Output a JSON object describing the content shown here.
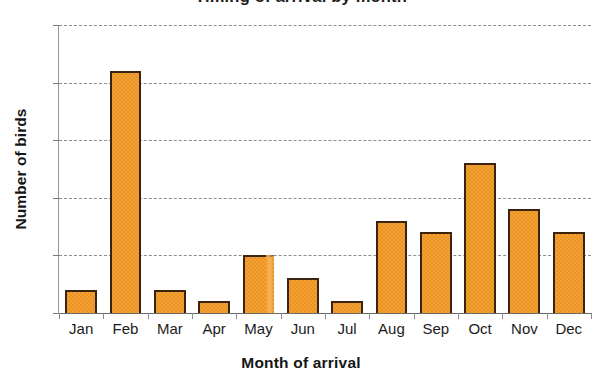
{
  "chart_data": {
    "type": "bar",
    "title": "Timing of arrival by month",
    "title_visibility": "cropped at top edge of image; only descenders visible",
    "categories": [
      "Jan",
      "Feb",
      "Mar",
      "Apr",
      "May",
      "Jun",
      "Jul",
      "Aug",
      "Sep",
      "Oct",
      "Nov",
      "Dec"
    ],
    "values": [
      2,
      21,
      2,
      1,
      5,
      3,
      1,
      8,
      7,
      13,
      9,
      7
    ],
    "xlabel": "Month of arrival",
    "ylabel": "Number of birds",
    "ylim": [
      0,
      25
    ],
    "yticks": [
      0,
      5,
      10,
      15,
      20,
      25
    ],
    "ytick_labels": [
      "0",
      "5",
      "10",
      "15",
      "20",
      "25"
    ],
    "grid": "horizontal dashed gridlines",
    "legend": "none",
    "bar_color": "#f5a032",
    "bar_edge_color": "#3a2410",
    "gridline_color": "#8d8d8d",
    "background": "#ffffff",
    "annotations": [
      "May bar right edge is blurred/faded (scan artifact)"
    ]
  },
  "axes": {
    "y_title": "Number of birds",
    "x_title": "Month of arrival"
  },
  "icons": {
    "gridline": "dashed-line-icon",
    "tick": "tick-mark-icon"
  }
}
